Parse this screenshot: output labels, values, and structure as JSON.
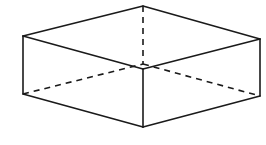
{
  "diagram": {
    "stroke_color": "#1a1a1a",
    "background": "#ffffff",
    "vertices": {
      "top_back": [
        143,
        6
      ],
      "top_left": [
        23,
        36
      ],
      "top_right": [
        260,
        39
      ],
      "top_front": [
        143,
        69
      ],
      "bottom_left": [
        23,
        94
      ],
      "bottom_right": [
        260,
        96
      ],
      "bottom_front": [
        143,
        127
      ],
      "bottom_back_hidden": [
        143,
        64
      ]
    },
    "visible_edges": [
      {
        "name": "top-left-back",
        "from": "top_left",
        "to": "top_back"
      },
      {
        "name": "top-back-right",
        "from": "top_back",
        "to": "top_right"
      },
      {
        "name": "top-left-front",
        "from": "top_left",
        "to": "top_front"
      },
      {
        "name": "top-front-right",
        "from": "top_front",
        "to": "top_right"
      },
      {
        "name": "left-vertical",
        "from": "top_left",
        "to": "bottom_left"
      },
      {
        "name": "front-vertical",
        "from": "top_front",
        "to": "bottom_front"
      },
      {
        "name": "right-vertical",
        "from": "top_right",
        "to": "bottom_right"
      },
      {
        "name": "bottom-left-front",
        "from": "bottom_left",
        "to": "bottom_front"
      },
      {
        "name": "bottom-front-right",
        "from": "bottom_front",
        "to": "bottom_right"
      }
    ],
    "hidden_edges": [
      {
        "name": "back-vertical",
        "from": "top_back",
        "to": "bottom_back_hidden"
      },
      {
        "name": "bottom-left-back",
        "from": "bottom_left",
        "to": "bottom_back_hidden"
      },
      {
        "name": "bottom-back-right",
        "from": "bottom_back_hidden",
        "to": "bottom_right"
      }
    ]
  }
}
